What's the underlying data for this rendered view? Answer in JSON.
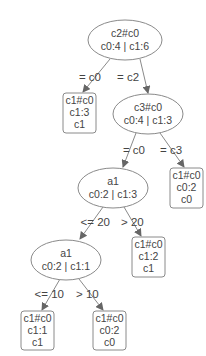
{
  "diagram": {
    "type": "decision-tree",
    "colors": {
      "stroke": "#8a8a8a",
      "text": "#444444",
      "background": "#ffffff"
    },
    "nodes": [
      {
        "id": "n0",
        "kind": "split",
        "line1": "c2#c0",
        "line2": "c0:4 | c1:6"
      },
      {
        "id": "n1",
        "kind": "leaf",
        "line1": "c1#c0",
        "line2": "c1:3",
        "line3": "c1"
      },
      {
        "id": "n2",
        "kind": "split",
        "line1": "c3#c0",
        "line2": "c0:4 | c1:3"
      },
      {
        "id": "n3",
        "kind": "split",
        "line1": "a1",
        "line2": "c0:2 | c1:3"
      },
      {
        "id": "n4",
        "kind": "leaf",
        "line1": "c1#c0",
        "line2": "c0:2",
        "line3": "c0"
      },
      {
        "id": "n5",
        "kind": "split",
        "line1": "a1",
        "line2": "c0:2 | c1:1"
      },
      {
        "id": "n6",
        "kind": "leaf",
        "line1": "c1#c0",
        "line2": "c1:2",
        "line3": "c1"
      },
      {
        "id": "n7",
        "kind": "leaf",
        "line1": "c1#c0",
        "line2": "c1:1",
        "line3": "c1"
      },
      {
        "id": "n8",
        "kind": "leaf",
        "line1": "c1#c0",
        "line2": "c0:2",
        "line3": "c0"
      }
    ],
    "edges": [
      {
        "from": "n0",
        "to": "n1",
        "label": "= c0"
      },
      {
        "from": "n0",
        "to": "n2",
        "label": "= c2"
      },
      {
        "from": "n2",
        "to": "n3",
        "label": "= c0"
      },
      {
        "from": "n2",
        "to": "n4",
        "label": "= c3"
      },
      {
        "from": "n3",
        "to": "n5",
        "label": "<= 20"
      },
      {
        "from": "n3",
        "to": "n6",
        "label": "> 20"
      },
      {
        "from": "n5",
        "to": "n7",
        "label": "<= 10"
      },
      {
        "from": "n5",
        "to": "n8",
        "label": "> 10"
      }
    ]
  }
}
